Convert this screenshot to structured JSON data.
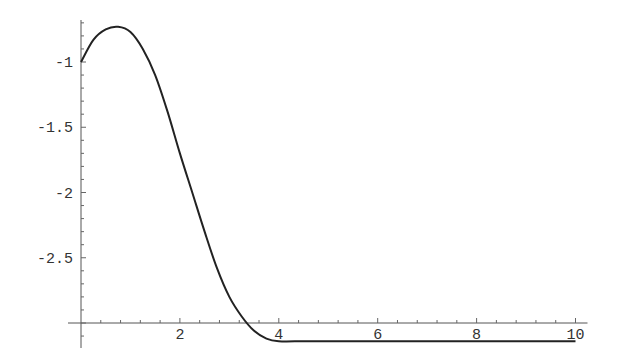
{
  "chart_data": {
    "type": "line",
    "title": "",
    "xlabel": "",
    "ylabel": "",
    "xlim": [
      0,
      10
    ],
    "ylim": [
      -3.14,
      -0.73
    ],
    "axes_origin": {
      "x": 0,
      "y": -3.0
    },
    "grid": false,
    "legend": null,
    "x_ticks": [
      2,
      4,
      6,
      8,
      10
    ],
    "x_tick_labels": [
      "2",
      "4",
      "6",
      "8",
      "10"
    ],
    "y_ticks": [
      -1,
      -1.5,
      -2,
      -2.5
    ],
    "y_tick_labels": [
      "-1",
      "-1.5",
      "-2",
      "-2.5"
    ],
    "series": [
      {
        "name": "f(x)",
        "color": "#222222",
        "x": [
          0,
          0.25,
          0.5,
          0.75,
          1.0,
          1.25,
          1.5,
          1.75,
          2.0,
          2.25,
          2.5,
          2.75,
          3.0,
          3.25,
          3.5,
          3.75,
          4.0,
          4.5,
          5,
          6,
          7,
          8,
          9,
          10
        ],
        "y": [
          -1.0,
          -0.83,
          -0.75,
          -0.73,
          -0.77,
          -0.9,
          -1.1,
          -1.38,
          -1.7,
          -2.0,
          -2.3,
          -2.58,
          -2.8,
          -2.95,
          -3.06,
          -3.12,
          -3.14,
          -3.14,
          -3.14,
          -3.14,
          -3.14,
          -3.14,
          -3.14,
          -3.14
        ]
      }
    ]
  }
}
